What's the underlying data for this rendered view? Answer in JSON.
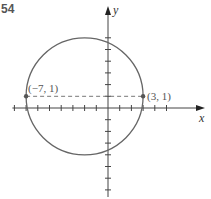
{
  "problem_number": "54",
  "diagram": {
    "axes": {
      "x_label": "x",
      "y_label": "y",
      "x_range": [
        -8,
        5
      ],
      "y_range": [
        -7,
        6
      ]
    },
    "circle": {
      "center": [
        -2,
        1
      ],
      "radius": 5
    },
    "points": [
      {
        "coords": [
          -7,
          1
        ],
        "label": "(−7, 1)"
      },
      {
        "coords": [
          3,
          1
        ],
        "label": "(3, 1)"
      }
    ],
    "dashed_segment": {
      "from": [
        -7,
        1
      ],
      "to": [
        3,
        1
      ]
    },
    "colors": {
      "circle": "#666666",
      "axis": "#444444",
      "dash": "#777777"
    }
  }
}
